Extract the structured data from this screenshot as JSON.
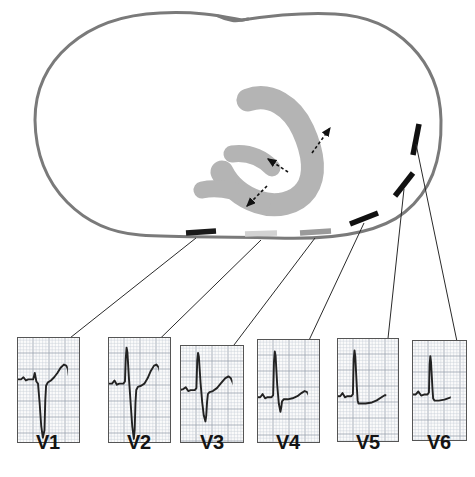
{
  "figure": {
    "kind": "precordial-lead-placement-cross-section",
    "background_color": "#ffffff"
  },
  "torso": {
    "name": "thorax-cross-section-outline",
    "stroke_color": "#7a7a7a",
    "stroke_width": 3,
    "fill_color": "#ffffff"
  },
  "heart": {
    "name": "heart-horseshoe-region",
    "fill_color": "#b4b4b4",
    "description": "C-shaped myocardial region"
  },
  "arrows": {
    "name": "depolarization-vector-arrows",
    "color": "#111111",
    "style": "dashed",
    "count": 3,
    "items": [
      {
        "label": "arrow-upper",
        "x1": 312,
        "y1": 153,
        "x2": 330,
        "y2": 128
      },
      {
        "label": "arrow-middle",
        "x1": 288,
        "y1": 172,
        "x2": 268,
        "y2": 159
      },
      {
        "label": "arrow-lower",
        "x1": 267,
        "y1": 186,
        "x2": 247,
        "y2": 206
      }
    ]
  },
  "electrodes": {
    "name": "precordial-electrode-bars",
    "items": [
      {
        "id": "V1",
        "color": "#1a1a1a",
        "x1": 186,
        "y1": 233,
        "x2": 216,
        "y2": 231
      },
      {
        "id": "V2",
        "color": "#d2d2d2",
        "x1": 245,
        "y1": 234,
        "x2": 277,
        "y2": 233
      },
      {
        "id": "V3",
        "color": "#9a9a9a",
        "x1": 300,
        "y1": 233,
        "x2": 331,
        "y2": 231
      },
      {
        "id": "V4",
        "color": "#111111",
        "x1": 350,
        "y1": 224,
        "x2": 378,
        "y2": 213
      },
      {
        "id": "V5",
        "color": "#111111",
        "x1": 395,
        "y1": 196,
        "x2": 413,
        "y2": 173
      },
      {
        "id": "V6",
        "color": "#111111",
        "x1": 413,
        "y1": 155,
        "x2": 419,
        "y2": 124
      }
    ]
  },
  "leader_lines": {
    "name": "electrode-to-trace-leader-lines",
    "color": "#2a2a2a",
    "width": 1
  },
  "panels": {
    "grid": {
      "minor_color": "#c8cdd6",
      "major_color": "#9aa2ae",
      "border_color": "#555555",
      "paper_color": "#fbfbfb"
    },
    "trace_color": "#222222",
    "items": [
      {
        "label": "V1",
        "name": "ecg-panel-v1",
        "x": 17,
        "y": 337,
        "w": 63,
        "h": 106,
        "label_x": 48,
        "label_y": 446,
        "lead_from": {
          "x": 196,
          "y": 234
        },
        "morphology": "rS with deep S wave, small r, upright T",
        "r_amplitude_mm": 1.5,
        "s_amplitude_mm": 14,
        "t_amplitude_mm": 3.5,
        "trace": "M0,40 L5,40 L8,38 L11,41 L14,40 L20,40 L22,34 L24,42 L26,44 L28,62 L30,84 L32,95 L34,88 L35,60 L36,46 L38,43 L42,41 L46,38 L50,34 L54,29 L58,26 L61,27 L63,30 L64,36 L66,39 L72,39 L78,39"
      },
      {
        "label": "V2",
        "name": "ecg-panel-v2",
        "x": 108,
        "y": 337,
        "w": 63,
        "h": 106,
        "label_x": 139,
        "label_y": 446,
        "lead_from": {
          "x": 261,
          "y": 236
        },
        "morphology": "tall R with deep S, prominent upright T",
        "r_amplitude_mm": 11,
        "s_amplitude_mm": 14,
        "t_amplitude_mm": 5,
        "trace": "M0,44 L5,44 L8,41 L11,45 L14,44 L19,44 L21,42 L22,20 L23,10 L24,14 L26,40 L28,62 L30,84 L32,96 L33,88 L34,62 L35,50 L37,47 L41,46 L45,44 L49,39 L53,32 L57,27 L60,26 L63,29 L65,35 L67,40 L72,41 L78,41"
      },
      {
        "label": "V3",
        "name": "ecg-panel-v3",
        "x": 180,
        "y": 345,
        "w": 64,
        "h": 98,
        "label_x": 212,
        "label_y": 446,
        "lead_from": {
          "x": 315,
          "y": 234
        },
        "morphology": "transition zone, tall R, moderate S, upright T",
        "r_amplitude_mm": 13,
        "s_amplitude_mm": 9,
        "t_amplitude_mm": 4,
        "trace": "M0,46 L4,45 L7,43 L10,47 L13,46 L18,46 L20,44 L21,16 L22,8 L23,12 L25,38 L27,58 L29,72 L31,78 L32,72 L33,58 L34,50 L36,48 L40,47 L45,44 L50,39 L55,34 L59,32 L62,34 L64,38 L66,42 L70,43 L78,43"
      },
      {
        "label": "V4",
        "name": "ecg-panel-v4",
        "x": 257,
        "y": 339,
        "w": 63,
        "h": 104,
        "label_x": 288,
        "label_y": 446,
        "lead_from": {
          "x": 364,
          "y": 219
        },
        "morphology": "dominant R wave, small s, low upright T",
        "r_amplitude_mm": 15,
        "s_amplitude_mm": 5,
        "t_amplitude_mm": 2.5,
        "trace": "M0,56 L4,56 L7,53 L10,57 L13,56 L18,56 L20,54 L21,22 L22,12 L23,16 L25,44 L27,62 L29,70 L30,66 L31,60 L33,58 L38,58 L44,57 L50,55 L55,52 L59,50 L62,51 L64,54 L66,56 L72,56 L78,56"
      },
      {
        "label": "V5",
        "name": "ecg-panel-v5",
        "x": 337,
        "y": 338,
        "w": 62,
        "h": 104,
        "label_x": 368,
        "label_y": 446,
        "lead_from": {
          "x": 404,
          "y": 185
        },
        "morphology": "tall narrow R, minimal s, flat ST, low T",
        "r_amplitude_mm": 14,
        "s_amplitude_mm": 1,
        "t_amplitude_mm": 2,
        "trace": "M0,56 L4,56 L7,53 L10,57 L13,56 L18,56 L20,54 L21,20 L22,12 L23,18 L25,48 L26,60 L27,63 L30,63 L36,63 L44,62 L50,60 L56,57 L60,55 L64,55 L70,56 L78,56"
      },
      {
        "label": "V6",
        "name": "ecg-panel-v6",
        "x": 412,
        "y": 340,
        "w": 55,
        "h": 101,
        "label_x": 439,
        "label_y": 446,
        "lead_from": {
          "x": 416,
          "y": 140
        },
        "morphology": "qR pattern, moderate R, flat ST, low T",
        "r_amplitude_mm": 11,
        "s_amplitude_mm": 1,
        "t_amplitude_mm": 2,
        "trace": "M0,54 L5,54 L9,51 L13,55 L17,54 L22,54 L24,52 L25,24 L26,16 L27,22 L29,48 L30,58 L32,60 L38,60 L46,59 L54,57 L62,55 L70,54 L78,54"
      }
    ]
  }
}
